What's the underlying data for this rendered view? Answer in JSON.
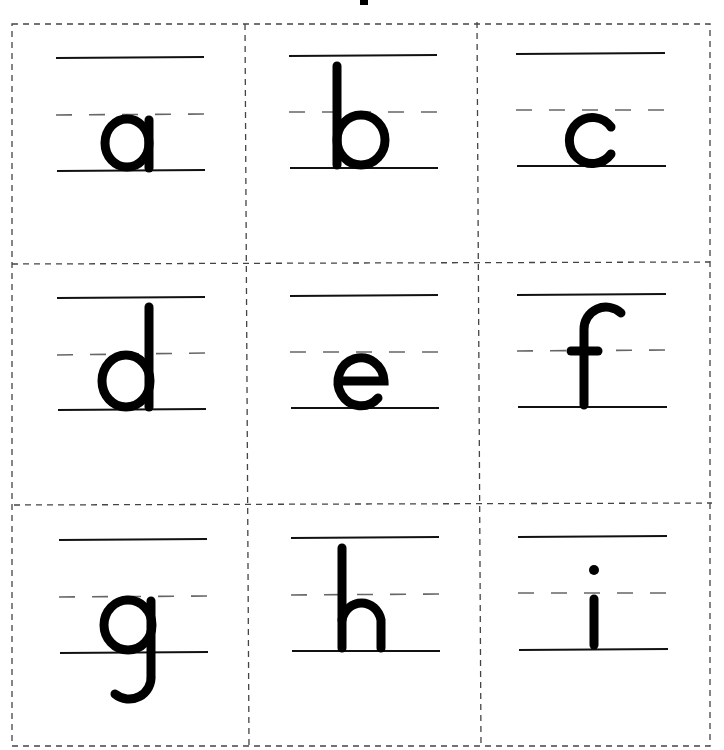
{
  "worksheet": {
    "title_fragment": "",
    "cards": [
      {
        "letter": "a",
        "row": 0,
        "col": 0
      },
      {
        "letter": "b",
        "row": 0,
        "col": 1
      },
      {
        "letter": "c",
        "row": 0,
        "col": 2
      },
      {
        "letter": "d",
        "row": 1,
        "col": 0
      },
      {
        "letter": "e",
        "row": 1,
        "col": 1
      },
      {
        "letter": "f",
        "row": 1,
        "col": 2
      },
      {
        "letter": "g",
        "row": 2,
        "col": 0
      },
      {
        "letter": "h",
        "row": 2,
        "col": 1
      },
      {
        "letter": "i",
        "row": 2,
        "col": 2
      }
    ],
    "colors": {
      "ink": "#000000",
      "guide_solid": "#111111",
      "guide_dashed": "#666666",
      "cut_line": "#444444",
      "paper": "#ffffff"
    }
  }
}
